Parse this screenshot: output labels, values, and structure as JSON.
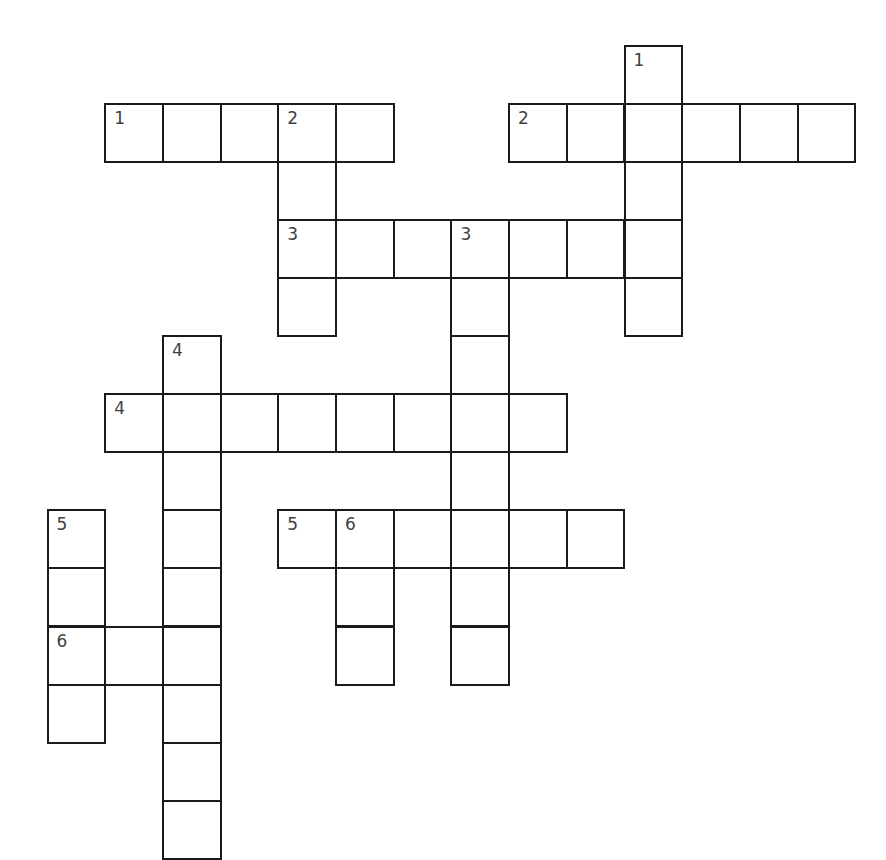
{
  "puzzle": {
    "type": "crossword",
    "grid": {
      "origin_x": 46.5,
      "origin_y": 44.5,
      "pitch_x": 57.7,
      "pitch_y": 58.1,
      "line_color": "#1a1a1a",
      "number_color": "#404040"
    },
    "across": [
      {
        "number": "1",
        "row": 1,
        "col": 1,
        "length": 5
      },
      {
        "number": "2",
        "row": 1,
        "col": 8,
        "length": 6
      },
      {
        "number": "3",
        "row": 3,
        "col": 4,
        "length": 7
      },
      {
        "number": "4",
        "row": 6,
        "col": 1,
        "length": 8
      },
      {
        "number": "5",
        "row": 8,
        "col": 4,
        "length": 6
      },
      {
        "number": "6",
        "row": 10,
        "col": 0,
        "length": 3
      }
    ],
    "down": [
      {
        "number": "1",
        "row": 0,
        "col": 10,
        "length": 5
      },
      {
        "number": "2",
        "row": 1,
        "col": 4,
        "length": 4
      },
      {
        "number": "3",
        "row": 3,
        "col": 7,
        "length": 8
      },
      {
        "number": "4",
        "row": 5,
        "col": 2,
        "length": 9
      },
      {
        "number": "5",
        "row": 8,
        "col": 0,
        "length": 4
      },
      {
        "number": "6",
        "row": 8,
        "col": 5,
        "length": 3
      }
    ]
  }
}
